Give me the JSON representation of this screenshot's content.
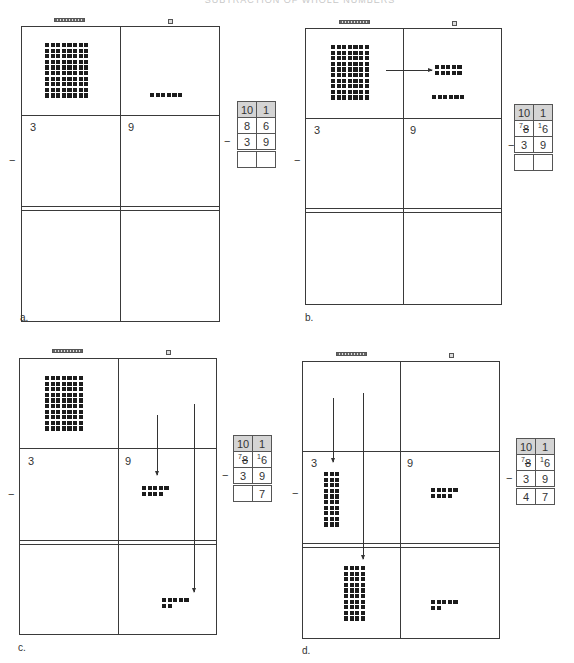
{
  "header": {
    "title": "SUBTRACTION OF WHOLE NUMBERS"
  },
  "column_icons": {
    "tens": "ten-rod-icon",
    "ones": "unit-cube-icon"
  },
  "operator": "−",
  "panels": [
    {
      "id": "a",
      "label": "a.",
      "minuend_tens_blocks": 8,
      "minuend_ones_blocks": 6,
      "subtrahend_tens": "3",
      "subtrahend_ones": "9",
      "table": {
        "headers": [
          "10",
          "1"
        ],
        "rows": [
          [
            "8",
            "6"
          ],
          [
            "3",
            "9"
          ]
        ],
        "result": [
          "",
          ""
        ]
      }
    },
    {
      "id": "b",
      "label": "b.",
      "minuend_tens_blocks": 7,
      "regrouped_ones_blocks": 10,
      "minuend_ones_blocks": 6,
      "subtrahend_tens": "3",
      "subtrahend_ones": "9",
      "table": {
        "headers": [
          "10",
          "1"
        ],
        "row1": {
          "tens_new": "7",
          "tens_old": "8",
          "ones_new": "1",
          "ones_old": "6"
        },
        "row2": [
          "3",
          "9"
        ],
        "result": [
          "",
          ""
        ]
      }
    },
    {
      "id": "c",
      "label": "c.",
      "minuend_tens_blocks": 7,
      "removed_ones_blocks": 9,
      "remaining_ones_blocks": 7,
      "subtrahend_tens": "3",
      "subtrahend_ones": "9",
      "table": {
        "headers": [
          "10",
          "1"
        ],
        "row1": {
          "tens_new": "7",
          "tens_old": "8",
          "ones_new": "1",
          "ones_old": "6"
        },
        "row2": [
          "3",
          "9"
        ],
        "result": [
          "",
          "7"
        ]
      }
    },
    {
      "id": "d",
      "label": "d.",
      "removed_tens_blocks": 3,
      "remaining_tens_blocks": 4,
      "removed_ones_blocks": 9,
      "remaining_ones_blocks": 7,
      "subtrahend_tens": "3",
      "subtrahend_ones": "9",
      "table": {
        "headers": [
          "10",
          "1"
        ],
        "row1": {
          "tens_new": "7",
          "tens_old": "8",
          "ones_new": "1",
          "ones_old": "6"
        },
        "row2": [
          "3",
          "9"
        ],
        "result": [
          "4",
          "7"
        ]
      }
    }
  ]
}
